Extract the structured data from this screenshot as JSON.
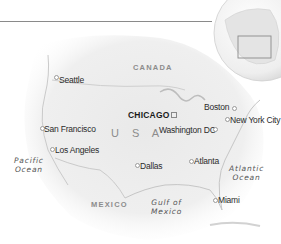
{
  "map": {
    "countries": {
      "canada": "CANADA",
      "usa": "U S A",
      "mexico": "MEXICO"
    },
    "water_bodies": {
      "pacific": [
        "Pacific",
        "Ocean"
      ],
      "atlantic": [
        "Atlantic",
        "Ocean"
      ],
      "gulf": [
        "Gulf of",
        "Mexico"
      ]
    },
    "capital": {
      "label": "CHICAGO"
    },
    "cities": {
      "seattle": "Seattle",
      "san_francisco": "San Francisco",
      "los_angeles": "Los Angeles",
      "washington": "Washington DC",
      "boston": "Boston",
      "new_york": "New York City",
      "dallas": "Dallas",
      "atlanta": "Atlanta",
      "miami": "Miami"
    },
    "locator_globe": {
      "highlight": "USA region box"
    }
  }
}
